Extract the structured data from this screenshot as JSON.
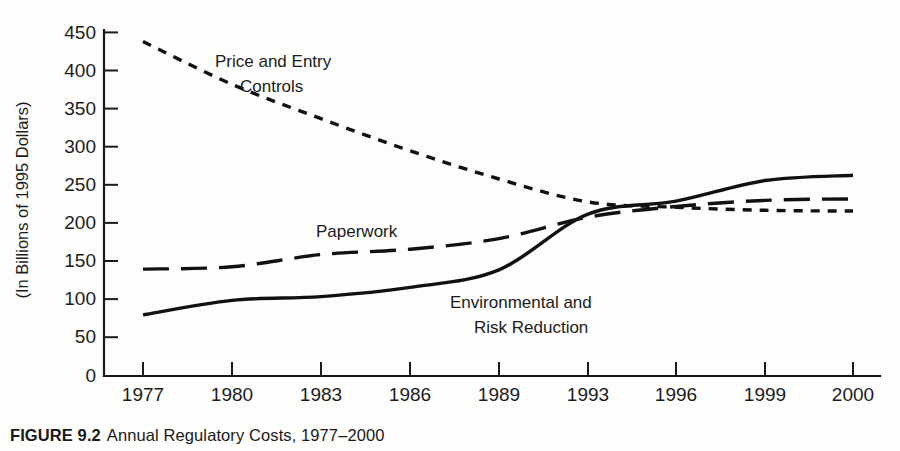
{
  "figure": {
    "caption_label": "FIGURE 9.2",
    "caption_text": "Annual Regulatory Costs, 1977–2000"
  },
  "chart_data": {
    "type": "line",
    "title": "Annual Regulatory Costs, 1977–2000",
    "xlabel": "",
    "ylabel": "(In Billions of 1995 Dollars)",
    "x": [
      1977,
      1980,
      1983,
      1986,
      1989,
      1993,
      1996,
      1999,
      2000
    ],
    "xticklabels": [
      "1977",
      "1980",
      "1983",
      "1986",
      "1989",
      "1993",
      "1996",
      "1999",
      "2000"
    ],
    "yticks": [
      0,
      50,
      100,
      150,
      200,
      250,
      300,
      350,
      400,
      450
    ],
    "yticklabels": [
      "0",
      "50",
      "100",
      "150",
      "200",
      "250",
      "300",
      "350",
      "400",
      "450"
    ],
    "ylim": [
      0,
      450
    ],
    "grid": false,
    "legend_position": "inline-annotations",
    "series": [
      {
        "name": "Price and Entry Controls",
        "style": "short-dashed",
        "label_line1": "Price and Entry",
        "label_line2": "Controls",
        "values": [
          438,
          382,
          337,
          295,
          258,
          228,
          221,
          217,
          216
        ]
      },
      {
        "name": "Paperwork",
        "style": "long-dashed",
        "label_line1": "Paperwork",
        "label_line2": "",
        "values": [
          140,
          143,
          159,
          166,
          180,
          208,
          222,
          230,
          232
        ]
      },
      {
        "name": "Environmental and Risk Reduction",
        "style": "solid",
        "label_line1": "Environmental and",
        "label_line2": "Risk Reduction",
        "values": [
          80,
          99,
          104,
          116,
          139,
          212,
          229,
          256,
          263
        ]
      }
    ]
  }
}
